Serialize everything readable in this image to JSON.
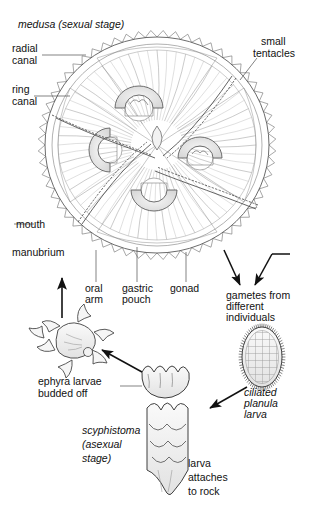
{
  "figure": {
    "background_color": "#ffffff",
    "line_color": "#4a4a4a",
    "fill_gray": "#e9e9e9"
  },
  "labels": {
    "medusa": "medusa (sexual stage)",
    "radial_canal_l1": "radial",
    "radial_canal_l2": "canal",
    "ring_canal_l1": "ring",
    "ring_canal_l2": "canal",
    "small_tentacles_l1": "small",
    "small_tentacles_l2": "tentacles",
    "mouth": "mouth",
    "manubrium": "manubrium",
    "oral_arm_l1": "oral",
    "oral_arm_l2": "arm",
    "gastric_pouch_l1": "gastric",
    "gastric_pouch_l2": "pouch",
    "gonad": "gonad",
    "gametes_l1": "gametes from",
    "gametes_l2": "different",
    "gametes_l3": "individuals",
    "ciliated_planula_l1": "ciliated",
    "ciliated_planula_l2": "planula",
    "ciliated_planula_l3": "larva",
    "ephyra_l1": "ephyra larvae",
    "ephyra_l2": "budded off",
    "scyphistoma_l1": "scyphistoma",
    "scyphistoma_l2": "(asexual",
    "scyphistoma_l3": "stage)",
    "larva_attaches_l1": "larva",
    "larva_attaches_l2": "attaches",
    "larva_attaches_l3": "to rock"
  },
  "stages": [
    {
      "name": "medusa",
      "label": "medusa (sexual stage)",
      "type": "sexual"
    },
    {
      "name": "gametes",
      "label": "gametes from different individuals",
      "type": "sexual"
    },
    {
      "name": "planula",
      "label": "ciliated planula larva",
      "type": "larval"
    },
    {
      "name": "scyphistoma",
      "label": "scyphistoma (asexual stage)",
      "type": "asexual"
    },
    {
      "name": "ephyra",
      "label": "ephyra larvae budded off",
      "type": "larval"
    }
  ],
  "medusa_parts": [
    "radial canal",
    "ring canal",
    "small tentacles",
    "mouth",
    "manubrium",
    "oral arm",
    "gastric pouch",
    "gonad"
  ]
}
